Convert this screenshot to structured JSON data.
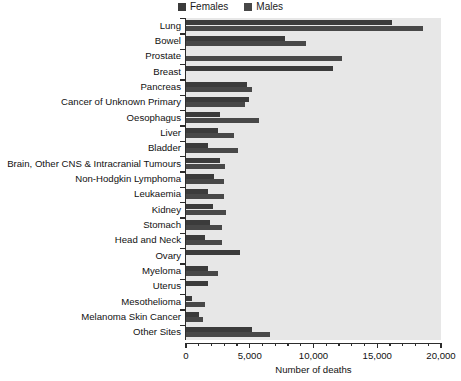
{
  "chart_data": {
    "type": "bar",
    "orientation": "horizontal",
    "title": "",
    "xlabel": "Number of deaths",
    "ylabel": "",
    "xlim": [
      0,
      20000
    ],
    "xticks": [
      0,
      5000,
      10000,
      15000,
      20000
    ],
    "xtick_labels": [
      "0",
      "5,000",
      "10,000",
      "15,000",
      "20,000"
    ],
    "minor_tick_interval": 1000,
    "grid": false,
    "legend_position": "top-center",
    "legend": [
      "Females",
      "Males"
    ],
    "categories": [
      "Lung",
      "Bowel",
      "Prostate",
      "Breast",
      "Pancreas",
      "Cancer of Unknown Primary",
      "Oesophagus",
      "Liver",
      "Bladder",
      "Brain, Other CNS & Intracranial Tumours",
      "Non-Hodgkin Lymphoma",
      "Leukaemia",
      "Kidney",
      "Stomach",
      "Head and Neck",
      "Ovary",
      "Myeloma",
      "Uterus",
      "Mesothelioma",
      "Melanoma Skin Cancer",
      "Other Sites"
    ],
    "series": [
      {
        "name": "Females",
        "color": "#3b3b3b",
        "values": [
          16150,
          7750,
          0,
          11550,
          4800,
          4950,
          2650,
          2500,
          1700,
          2650,
          2200,
          1750,
          2100,
          1900,
          1500,
          4250,
          1700,
          1750,
          500,
          1050,
          5200
        ]
      },
      {
        "name": "Males",
        "color": "#484848",
        "values": [
          18600,
          9400,
          12250,
          0,
          5200,
          4650,
          5750,
          3750,
          4100,
          3050,
          3000,
          2950,
          3150,
          2800,
          2800,
          0,
          2500,
          0,
          1500,
          1300,
          6600
        ]
      }
    ]
  },
  "colors": {
    "females": "#3b3b3b",
    "males": "#484848",
    "plot_background": "#e7e7e7",
    "axis": "#2c2c2c",
    "text": "#111111"
  }
}
